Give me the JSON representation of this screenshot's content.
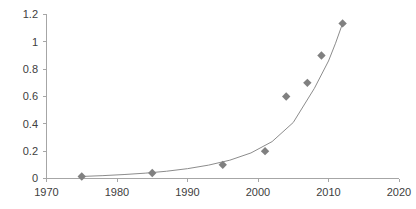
{
  "chart_data": {
    "type": "scatter",
    "title": "",
    "xlabel": "",
    "ylabel": "",
    "xlim": [
      1970,
      2020
    ],
    "ylim": [
      0,
      1.2
    ],
    "grid": false,
    "legend": "none",
    "x_ticks": [
      "1970",
      "1980",
      "1990",
      "2000",
      "2010",
      "2020"
    ],
    "x_tick_values": [
      1970,
      1980,
      1990,
      2000,
      2010,
      2020
    ],
    "y_ticks": [
      "0",
      "0.2",
      "0.4",
      "0.6",
      "0.8",
      "1",
      "1.2"
    ],
    "y_tick_values": [
      0,
      0.2,
      0.4,
      0.6,
      0.8,
      1,
      1.2
    ],
    "series": [
      {
        "name": "data points",
        "marker": "diamond",
        "color": "#808080",
        "x": [
          1975,
          1985,
          1995,
          2001,
          2004,
          2007,
          2009,
          2012
        ],
        "y": [
          0.015,
          0.04,
          0.1,
          0.2,
          0.6,
          0.7,
          0.9,
          1.135
        ]
      },
      {
        "name": "trend line",
        "type": "line",
        "color": "#8c8c8c",
        "x": [
          1975,
          1978,
          1981,
          1984,
          1987,
          1990,
          1993,
          1996,
          1999,
          2002,
          2005,
          2008,
          2010,
          2011,
          2012
        ],
        "y": [
          0.015,
          0.021,
          0.029,
          0.039,
          0.053,
          0.072,
          0.098,
          0.134,
          0.187,
          0.27,
          0.41,
          0.66,
          0.86,
          0.99,
          1.135
        ]
      }
    ]
  },
  "colors": {
    "marker": "#808080",
    "trend_line": "#8c8c8c",
    "axis": "#a6a6a6",
    "tick_text": "#404040",
    "background": "#ffffff"
  }
}
